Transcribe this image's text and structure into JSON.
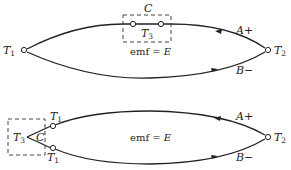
{
  "figure": {
    "colors": {
      "stroke": "#222222",
      "background": "#ffffff",
      "dashed_box": "#444444"
    },
    "top_diagram": {
      "junction_left": {
        "label": "T",
        "subscript": "1"
      },
      "junction_right": {
        "label": "T",
        "subscript": "2"
      },
      "box_label_top": "C",
      "box_label_inside": {
        "label": "T",
        "subscript": "3"
      },
      "emf_label": {
        "text": "emf = ",
        "var": "E"
      },
      "wire_upper": {
        "label": "A",
        "sign": "+"
      },
      "wire_lower": {
        "label": "B",
        "sign": "−"
      }
    },
    "bottom_diagram": {
      "junction_upper_left": {
        "label": "T",
        "subscript": "1"
      },
      "junction_lower_left": {
        "label": "T",
        "subscript": "1"
      },
      "junction_right": {
        "label": "T",
        "subscript": "2"
      },
      "box_label_inside": {
        "label": "T",
        "subscript": "3"
      },
      "box_label_c": "C",
      "emf_label": {
        "text": "emf = ",
        "var": "E"
      },
      "wire_upper": {
        "label": "A",
        "sign": "+"
      },
      "wire_lower": {
        "label": "B",
        "sign": "−"
      }
    }
  }
}
